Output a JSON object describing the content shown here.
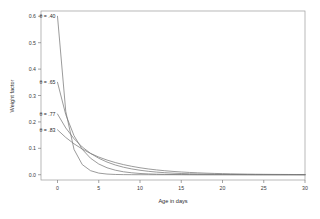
{
  "chart_data": {
    "type": "line",
    "title": "",
    "xlabel": "Age in days",
    "ylabel": "Weight factor",
    "xlim": [
      -2,
      30
    ],
    "ylim": [
      -0.02,
      0.62
    ],
    "xticks": [
      0,
      5,
      10,
      15,
      20,
      25,
      30
    ],
    "xtick_labels": [
      "0",
      "5",
      "10",
      "15",
      "20",
      "25",
      "30"
    ],
    "yticks": [
      0.0,
      0.1,
      0.2,
      0.3,
      0.4,
      0.5,
      0.6
    ],
    "ytick_labels": [
      "0.0",
      "0.1",
      "0.2",
      "0.3",
      "0.4",
      "0.5",
      "0.6"
    ],
    "grid": false,
    "legend_position": "inline-annotations",
    "x": [
      0,
      1,
      2,
      3,
      4,
      5,
      6,
      7,
      8,
      9,
      10,
      11,
      12,
      13,
      14,
      15,
      16,
      17,
      18,
      19,
      20,
      21,
      22,
      23,
      24,
      25,
      26,
      27,
      28,
      29,
      30
    ],
    "series": [
      {
        "name": "theta = .40",
        "label": "θ = .40",
        "theta": 0.4,
        "color": "#7a7a7a",
        "label_x": 0,
        "label_y": 0.6,
        "values": [
          0.6,
          0.24,
          0.096,
          0.0384,
          0.01536,
          0.006144,
          0.0024576,
          0.000983,
          0.000393,
          0.000157,
          6.29e-05,
          2.52e-05,
          1.01e-05,
          4e-06,
          1.6e-06,
          6.4e-07,
          2.6e-07,
          1e-07,
          4e-08,
          2e-08,
          1e-08,
          0,
          0,
          0,
          0,
          0,
          0,
          0,
          0,
          0,
          0
        ]
      },
      {
        "name": "theta = .65",
        "label": "θ = .65",
        "theta": 0.65,
        "color": "#7a7a7a",
        "label_x": 0,
        "label_y": 0.35,
        "values": [
          0.35,
          0.2275,
          0.1479,
          0.0961,
          0.0625,
          0.0406,
          0.0264,
          0.0172,
          0.0111,
          0.0073,
          0.0047,
          0.0031,
          0.002,
          0.0013,
          0.00084,
          0.00055,
          0.00036,
          0.00023,
          0.00015,
          0.0001,
          6.4e-05,
          4.1e-05,
          2.7e-05,
          1.7e-05,
          1.1e-05,
          7.3e-06,
          4.8e-06,
          3.1e-06,
          2e-06,
          1.3e-06,
          8.5e-07
        ]
      },
      {
        "name": "theta = .77",
        "label": "θ = .77",
        "theta": 0.77,
        "color": "#7a7a7a",
        "label_x": 0,
        "label_y": 0.23,
        "values": [
          0.23,
          0.1771,
          0.1364,
          0.105,
          0.0809,
          0.0623,
          0.048,
          0.0369,
          0.0284,
          0.0219,
          0.0169,
          0.013,
          0.01,
          0.0077,
          0.0059,
          0.0046,
          0.0035,
          0.0027,
          0.0021,
          0.0016,
          0.0012,
          0.00095,
          0.00073,
          0.00056,
          0.00043,
          0.00033,
          0.00026,
          0.0002,
          0.00015,
          0.00012,
          9e-05
        ]
      },
      {
        "name": "theta = .83",
        "label": "θ = .83",
        "theta": 0.83,
        "color": "#7a7a7a",
        "label_x": 0,
        "label_y": 0.17,
        "values": [
          0.17,
          0.1411,
          0.1171,
          0.0972,
          0.0807,
          0.0669,
          0.0556,
          0.0461,
          0.0383,
          0.0318,
          0.0264,
          0.0219,
          0.0182,
          0.0151,
          0.0125,
          0.0104,
          0.0086,
          0.0072,
          0.0059,
          0.0049,
          0.0041,
          0.0034,
          0.0028,
          0.0023,
          0.0019,
          0.0016,
          0.0013,
          0.0011,
          0.0009,
          0.00075,
          0.00062
        ]
      }
    ]
  },
  "axes": {
    "x_title": "Age in days",
    "y_title": "Weight factor"
  }
}
